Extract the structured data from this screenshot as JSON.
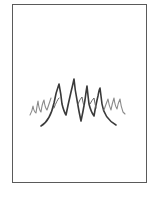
{
  "illustration": {
    "subject": "scribble-zigzag-drawing",
    "frame_color": "#5a5a5a",
    "stroke_dark": "#3a3a3a",
    "stroke_light": "#8a8a8a"
  }
}
